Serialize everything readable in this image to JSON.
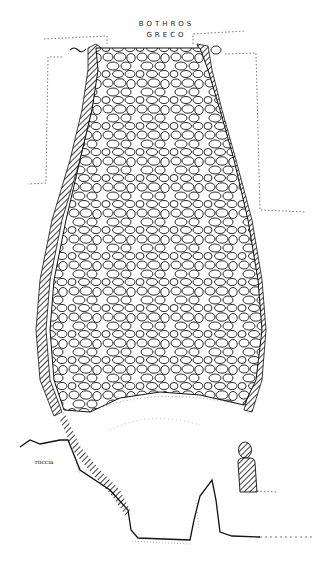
{
  "drawing": {
    "title_line1": "BOTHROS",
    "title_line2": "GRECO",
    "rock_label": "roccia",
    "type": "archaeological section drawing",
    "colors": {
      "ink": "#111111",
      "paper": "#ffffff",
      "dotted": "#555555"
    }
  }
}
